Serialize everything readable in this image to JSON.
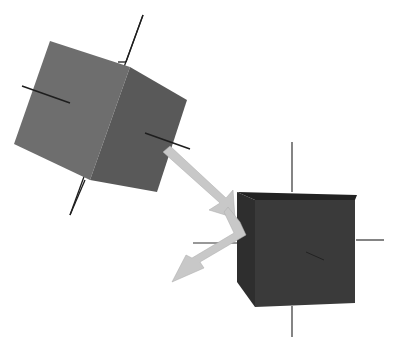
{
  "scene": {
    "description": "Two 3D cubes with axis lines; a light gray bent arrow from the rotated cube toward the aligned cube",
    "colors": {
      "background": "#ffffff",
      "cube1_front": "#6e6e6e",
      "cube1_side": "#5a5a5a",
      "cube2_front": "#3a3a3a",
      "cube2_side": "#2e2e2e",
      "axis": "#1e1e1e",
      "arrow": "#c8c8c8"
    }
  }
}
